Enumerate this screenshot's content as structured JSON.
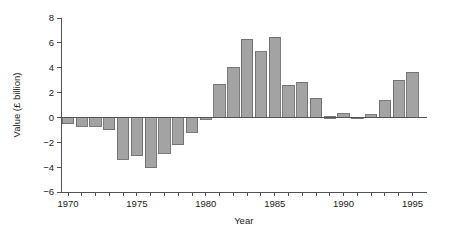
{
  "chart_data": {
    "type": "bar",
    "title": "",
    "xlabel": "Year",
    "ylabel": "Value (£ billion)",
    "categories": [
      1970,
      1971,
      1972,
      1973,
      1974,
      1975,
      1976,
      1977,
      1978,
      1979,
      1980,
      1981,
      1982,
      1983,
      1984,
      1985,
      1986,
      1987,
      1988,
      1989,
      1990,
      1991,
      1992,
      1993,
      1994,
      1995
    ],
    "values": [
      -0.5,
      -0.7,
      -0.7,
      -1.0,
      -3.35,
      -3.1,
      -4.05,
      -2.9,
      -2.2,
      -1.2,
      -0.15,
      2.65,
      4.05,
      6.3,
      5.3,
      6.45,
      2.6,
      2.85,
      1.55,
      0.05,
      0.3,
      -0.1,
      0.2,
      1.35,
      3.0,
      3.65
    ],
    "ylim": [
      -6,
      8
    ],
    "xlim": [
      1969.4,
      1995.8
    ],
    "ytick_values": [
      -6,
      -4,
      -2,
      0,
      2,
      4,
      6,
      8
    ],
    "ytick_labels": [
      "−6",
      "−4",
      "−2",
      "0",
      "2",
      "4",
      "6",
      "8"
    ],
    "xtick_values": [
      1970,
      1971,
      1972,
      1973,
      1974,
      1975,
      1976,
      1977,
      1978,
      1979,
      1980,
      1981,
      1982,
      1983,
      1984,
      1985,
      1986,
      1987,
      1988,
      1989,
      1990,
      1991,
      1992,
      1993,
      1994,
      1995
    ],
    "xtick_labeled": [
      1970,
      1975,
      1980,
      1985,
      1990,
      1995
    ],
    "xtick_labels": [
      "1970",
      "1975",
      "1980",
      "1985",
      "1990",
      "1995"
    ],
    "grid": false,
    "legend": null,
    "bar_color": "#a3a3a3",
    "bar_edge_color": "#6e6e6e",
    "axis_color": "#545454",
    "baseline_value": 0,
    "bar_width_years": 0.82
  }
}
